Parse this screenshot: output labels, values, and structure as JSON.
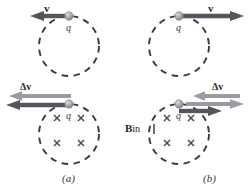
{
  "figure": {
    "type": "physics-diagram",
    "colors": {
      "dark_arrow": "#55555f",
      "light_arrow": "#9a9aa2",
      "circle_stroke": "#3a3a44",
      "cross_mark": "#4a4a55",
      "charge_dot": "#9b9ba3",
      "text": "#25252c",
      "background": "#ffffff"
    },
    "panels": [
      {
        "id": "a",
        "panel_label": "(a)",
        "top": {
          "velocity_label": "v",
          "velocity_direction": "left",
          "charge_label": "q",
          "circle_style": "dashed"
        },
        "bottom": {
          "delta_v_label": "Δv",
          "delta_v_direction": "left",
          "resultant_direction": "left",
          "charge_label": "q",
          "field_marks": "×",
          "field_mark_count": 4,
          "circle_style": "dashed"
        }
      },
      {
        "id": "b",
        "panel_label": "(b)",
        "top": {
          "velocity_label": "v",
          "velocity_direction": "right",
          "charge_label": "q",
          "circle_style": "dashed"
        },
        "bottom": {
          "delta_v_label": "Δv",
          "delta_v_direction": "left",
          "resultant_direction": "right",
          "charge_label": "q",
          "field_marks": "×",
          "field_mark_count": 4,
          "circle_style": "dashed"
        }
      }
    ],
    "field_label": {
      "symbol": "B",
      "subscript": "in",
      "full": "B in"
    }
  }
}
